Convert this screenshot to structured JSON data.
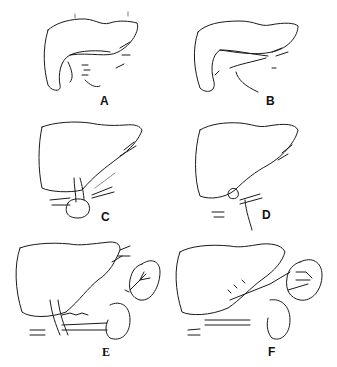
{
  "figure": {
    "panels": [
      {
        "label": "A"
      },
      {
        "label": "B"
      },
      {
        "label": "C"
      },
      {
        "label": "D"
      },
      {
        "label": "E"
      },
      {
        "label": "F"
      }
    ]
  },
  "colors": {
    "ink": "#1a1a1a",
    "background": "#ffffff"
  }
}
